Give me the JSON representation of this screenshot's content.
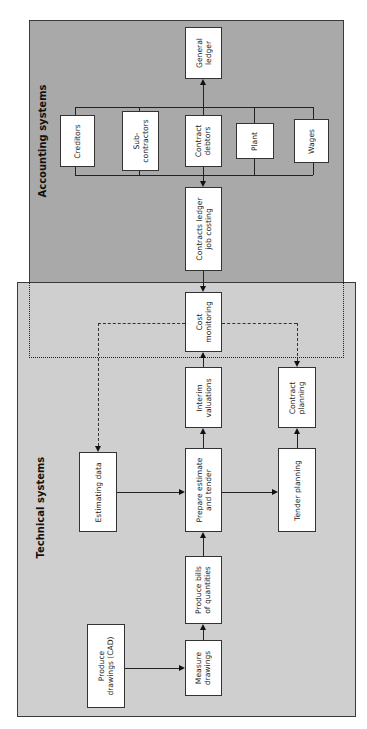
{
  "regions": {
    "accounting": {
      "title": "Accounting systems",
      "color": "#a9a9a9"
    },
    "technical": {
      "title": "Technical systems",
      "color": "#cfcfcf"
    }
  },
  "nodes": {
    "general_ledger": "General\nledger",
    "creditors": "Creditors",
    "subcontractors": "Sub-\ncontractors",
    "contract_debtors": "Contract\ndebtors",
    "plant": "Plant",
    "wages": "Wages",
    "contracts_ledger": "Contracts ledger\njob costing",
    "cost_monitoring": "Cost\nmonitoring",
    "interim_valuations": "Interim\nvaluations",
    "contract_planning": "Contract\nplanning",
    "estimating_data": "Estimating data",
    "prepare_estimate": "Prepare estimate\nand tender",
    "tender_planning": "Tender planning",
    "produce_bills": "Produce bills\nof quantities",
    "measure_drawings": "Measure\ndrawings",
    "produce_drawings": "Produce\ndrawings (CAD)"
  },
  "edges": [
    {
      "from": "Produce drawings (CAD)",
      "to": "Measure drawings",
      "style": "solid"
    },
    {
      "from": "Measure drawings",
      "to": "Produce bills of quantities",
      "style": "solid"
    },
    {
      "from": "Produce bills of quantities",
      "to": "Prepare estimate and tender",
      "style": "solid"
    },
    {
      "from": "Estimating data",
      "to": "Prepare estimate and tender",
      "style": "solid"
    },
    {
      "from": "Prepare estimate and tender",
      "to": "Tender planning",
      "style": "solid"
    },
    {
      "from": "Prepare estimate and tender",
      "to": "Interim valuations",
      "style": "solid"
    },
    {
      "from": "Tender planning",
      "to": "Contract planning",
      "style": "solid"
    },
    {
      "from": "Interim valuations",
      "to": "Cost monitoring",
      "style": "solid"
    },
    {
      "from": "Contracts ledger job costing",
      "to": "Cost monitoring",
      "style": "solid"
    },
    {
      "from": "Contract debtors group",
      "to": "Contracts ledger job costing",
      "style": "solid"
    },
    {
      "from": "Contract debtors group",
      "to": "General ledger",
      "style": "solid"
    },
    {
      "from": "Cost monitoring",
      "to": "Estimating data",
      "style": "dashed"
    },
    {
      "from": "Cost monitoring",
      "to": "Contract planning",
      "style": "dashed"
    }
  ]
}
